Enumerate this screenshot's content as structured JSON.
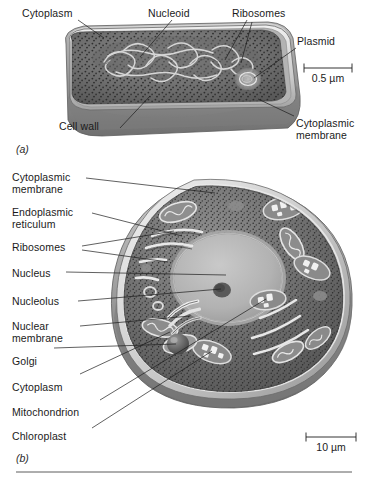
{
  "figure": {
    "type": "two-panel grayscale cell biology illustration",
    "panels": [
      {
        "tag": "(a)",
        "subject": "prokaryotic (bacterial) rod-shaped cell, cutaway view",
        "labels": [
          "Cytoplasm",
          "Nucleoid",
          "Ribosomes",
          "Plasmid",
          "Cell wall",
          "Cytoplasmic\nmembrane"
        ],
        "scale_bar": "0.5 µm"
      },
      {
        "tag": "(b)",
        "subject": "eukaryotic plant-like cell, cutaway view",
        "labels": [
          "Cytoplasmic\nmembrane",
          "Endoplasmic\nreticulum",
          "Ribosomes",
          "Nucleus",
          "Nucleolus",
          "Nuclear\nmembrane",
          "Golgi",
          "Cytoplasm",
          "Mitochondrion",
          "Chloroplast"
        ],
        "scale_bar": "10 µm"
      }
    ]
  },
  "panel_a": {
    "tag": "(a)",
    "scale_bar_label": "0.5 µm",
    "labels": {
      "cytoplasm": "Cytoplasm",
      "nucleoid": "Nucleoid",
      "ribosomes": "Ribosomes",
      "plasmid": "Plasmid",
      "cell_wall": "Cell wall",
      "cytoplasmic_membrane": "Cytoplasmic\nmembrane"
    }
  },
  "panel_b": {
    "tag": "(b)",
    "scale_bar_label": "10 µm",
    "labels": {
      "cytoplasmic_membrane": "Cytoplasmic\nmembrane",
      "endoplasmic_reticulum": "Endoplasmic\nreticulum",
      "ribosomes": "Ribosomes",
      "nucleus": "Nucleus",
      "nucleolus": "Nucleolus",
      "nuclear_membrane": "Nuclear\nmembrane",
      "golgi": "Golgi",
      "cytoplasm": "Cytoplasm",
      "mitochondrion": "Mitochondrion",
      "chloroplast": "Chloroplast"
    }
  },
  "colors": {
    "background": "#ffffff",
    "ink": "#1b1b1b",
    "cell_body_light": "#cfcfcf",
    "cell_body_mid": "#9a9a9a",
    "cell_body_dark": "#6d6d6d",
    "cytoplasm_dark": "#5f5f5f",
    "nucleus_fill": "#b9b9b9",
    "rule": "#4a4a4a"
  }
}
